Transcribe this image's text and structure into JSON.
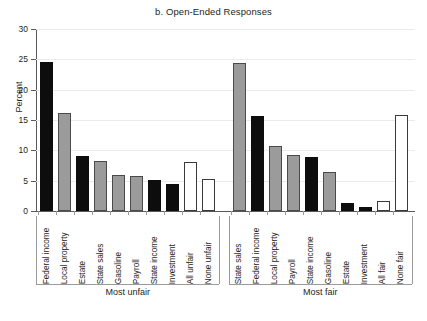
{
  "chart_data": {
    "type": "bar",
    "title": "b. Open-Ended Responses",
    "xlabel": "",
    "ylabel": "Percent",
    "ylim": [
      0,
      30
    ],
    "yticks": [
      0,
      5,
      10,
      15,
      20,
      25,
      30
    ],
    "grid": true,
    "legend": "none",
    "groups": [
      {
        "name": "Most unfair",
        "categories": [
          "Federal income",
          "Local property",
          "Estate",
          "State sales",
          "Gasoline",
          "Payroll",
          "State income",
          "Investment",
          "All unfair",
          "None unfair"
        ],
        "values": [
          24.5,
          16.1,
          9.0,
          8.2,
          6.0,
          5.8,
          5.1,
          4.4,
          8.1,
          5.3
        ],
        "fills": [
          "black",
          "gray",
          "black",
          "gray",
          "gray",
          "gray",
          "black",
          "black",
          "white",
          "white"
        ]
      },
      {
        "name": "Most fair",
        "categories": [
          "State sales",
          "Federal income",
          "Local property",
          "Payroll",
          "State income",
          "Gasoline",
          "Estate",
          "Investment",
          "All fair",
          "None fair"
        ],
        "values": [
          24.4,
          15.6,
          10.7,
          9.2,
          8.9,
          6.4,
          1.3,
          0.7,
          1.7,
          15.8
        ],
        "fills": [
          "gray",
          "black",
          "gray",
          "gray",
          "black",
          "gray",
          "black",
          "black",
          "white",
          "white"
        ]
      }
    ]
  },
  "colors": {
    "black_bar": "#0d0d0d",
    "gray_bar": "#9b9b9b",
    "white_bar": "#ffffff",
    "outline": "#3a3a3a",
    "axis": "#58595b",
    "gridline": "#eceaea",
    "text": "#231f20"
  }
}
